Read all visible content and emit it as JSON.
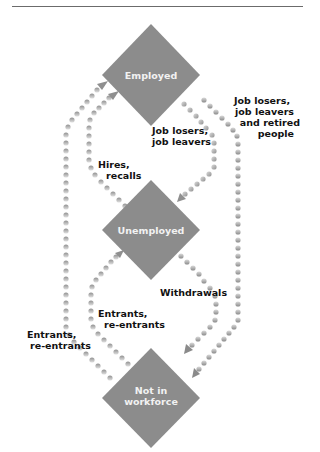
{
  "diagram": {
    "nodes": [
      {
        "id": "employed",
        "label": "Employed"
      },
      {
        "id": "unemployed",
        "label": "Unemployed"
      },
      {
        "id": "not_in_workforce",
        "label_line1": "Not in",
        "label_line2": "workforce"
      }
    ],
    "edges": [
      {
        "from": "employed",
        "to": "unemployed",
        "label_line1": "Job losers,",
        "label_line2": "job leavers"
      },
      {
        "from": "employed",
        "to": "not_in_workforce",
        "label_line1": "Job losers,",
        "label_line2": "job leavers",
        "label_line3": "and retired",
        "label_line4": "people"
      },
      {
        "from": "unemployed",
        "to": "employed",
        "label_line1": "Hires,",
        "label_line2": "recalls"
      },
      {
        "from": "unemployed",
        "to": "not_in_workforce",
        "label": "Withdrawals"
      },
      {
        "from": "not_in_workforce",
        "to": "unemployed",
        "label_line1": "Entrants,",
        "label_line2": "re-entrants"
      },
      {
        "from": "not_in_workforce",
        "to": "employed",
        "label_line1": "Entrants,",
        "label_line2": "re-entrants"
      }
    ],
    "colors": {
      "node_fill": "#8c8c8c",
      "dot_light": "#d4d4d4",
      "dot_dark": "#8f8f8f",
      "text": "#111111",
      "rule": "#6b6b6b"
    }
  }
}
